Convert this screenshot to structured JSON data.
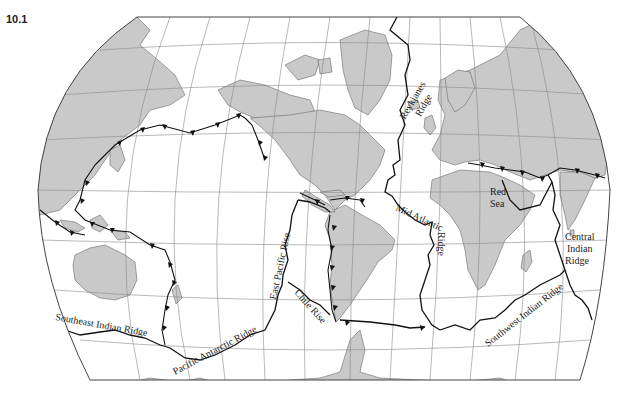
{
  "figure": {
    "number": "10.1"
  },
  "legend_symbols": {
    "ridge": "jagged black line (spreading ridge / transform)",
    "trench": "line with black triangles (subduction zone)"
  },
  "colors": {
    "land": "#c9c9c9",
    "ocean": "#ffffff",
    "boundary": "#111111",
    "graticule": "#8a8a8a"
  },
  "labels": {
    "reykjanes": [
      "Reykjanes",
      "Ridge"
    ],
    "red_sea": [
      "Red",
      "Sea"
    ],
    "mid_atlantic": "Mid Atlantic",
    "mid_atlantic_ridge": "Ridge",
    "central_indian": [
      "Central",
      "Indian",
      "Ridge"
    ],
    "east_pacific_rise": "East Pacific Rise",
    "chile_rise": "Chile Rise",
    "southeast_indian_ridge": "Southeast Indian Ridge",
    "pacific_antarctic_ridge": "Pacific Antarctic Ridge",
    "southwest_indian_ridge": "Southwest Indian Ridge"
  }
}
